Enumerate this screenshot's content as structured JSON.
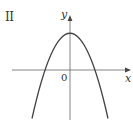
{
  "figure": {
    "panel_label": "II",
    "x_axis_label": "x",
    "y_axis_label": "y",
    "origin_label": "0",
    "curve": {
      "type": "downward-opening parabola",
      "vertex": "on positive y-axis",
      "x_intercepts": "two, symmetric about y-axis"
    },
    "colors": {
      "axes": "#555555",
      "curve": "#444444",
      "text": "#333333"
    }
  }
}
